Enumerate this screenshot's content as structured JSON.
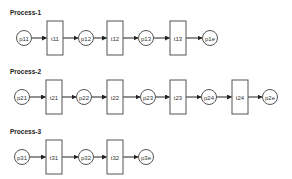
{
  "diagram": {
    "type": "petri-net",
    "colors": {
      "stroke": "#555555",
      "fill": "#ffffff",
      "text": "#222222"
    },
    "processes": [
      {
        "label": "Process-1",
        "y_label": 15,
        "cy": 38,
        "nodes": [
          {
            "kind": "place",
            "id": "p11",
            "cx": 24
          },
          {
            "kind": "transition",
            "id": "t11",
            "x": 47,
            "w": 16
          },
          {
            "kind": "place",
            "id": "p12",
            "cx": 86
          },
          {
            "kind": "transition",
            "id": "t12",
            "x": 107,
            "w": 16
          },
          {
            "kind": "place",
            "id": "p13",
            "cx": 146
          },
          {
            "kind": "transition",
            "id": "t13",
            "x": 170,
            "w": 16
          },
          {
            "kind": "place",
            "id": "p1e",
            "cx": 210
          }
        ]
      },
      {
        "label": "Process-2",
        "y_label": 74,
        "cy": 97,
        "nodes": [
          {
            "kind": "place",
            "id": "p21",
            "cx": 22
          },
          {
            "kind": "transition",
            "id": "t21",
            "x": 46,
            "w": 16
          },
          {
            "kind": "place",
            "id": "p22",
            "cx": 84
          },
          {
            "kind": "transition",
            "id": "t22",
            "x": 107,
            "w": 16
          },
          {
            "kind": "place",
            "id": "p23",
            "cx": 148
          },
          {
            "kind": "transition",
            "id": "t23",
            "x": 170,
            "w": 16
          },
          {
            "kind": "place",
            "id": "p24",
            "cx": 209
          },
          {
            "kind": "transition",
            "id": "t24",
            "x": 232,
            "w": 16
          },
          {
            "kind": "place",
            "id": "p2e",
            "cx": 270
          }
        ]
      },
      {
        "label": "Process-3",
        "y_label": 134,
        "cy": 157,
        "nodes": [
          {
            "kind": "place",
            "id": "p31",
            "cx": 22
          },
          {
            "kind": "transition",
            "id": "t31",
            "x": 46,
            "w": 16
          },
          {
            "kind": "place",
            "id": "p32",
            "cx": 86
          },
          {
            "kind": "transition",
            "id": "t32",
            "x": 107,
            "w": 16
          },
          {
            "kind": "place",
            "id": "p3e",
            "cx": 146
          }
        ]
      }
    ]
  }
}
